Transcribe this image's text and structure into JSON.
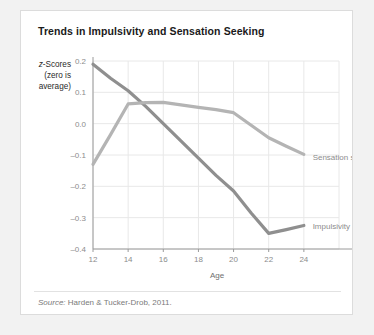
{
  "card": {
    "title": "Trends in Impulsivity and Sensation Seeking",
    "source_prefix": "Source:",
    "source_text": " Harden & Tucker-Drob, 2011."
  },
  "chart_data": {
    "type": "line",
    "title": "Trends in Impulsivity and Sensation Seeking",
    "xlabel": "Age",
    "ylabel": "z-Scores (zero is average)",
    "ylabel_line1": "z-Scores",
    "ylabel_line2": "(zero is",
    "ylabel_line3": "average)",
    "x": [
      12,
      13,
      14,
      15,
      16,
      17,
      18,
      19,
      20,
      21,
      22,
      23,
      24
    ],
    "xlim": [
      12,
      26
    ],
    "ylim": [
      -0.4,
      0.2
    ],
    "xticks": [
      12,
      14,
      16,
      18,
      20,
      22,
      24
    ],
    "xtick_labels": [
      "12",
      "14",
      "16",
      "18",
      "20",
      "22",
      "24"
    ],
    "yticks": [
      0.2,
      0.1,
      0.0,
      -0.1,
      -0.2,
      -0.3,
      -0.4
    ],
    "ytick_labels": [
      "0.2",
      "0.1",
      "0.0",
      "–0.1",
      "–0.2",
      "–0.3",
      "–0.4"
    ],
    "grid": true,
    "legend_position": "inline-right",
    "series": [
      {
        "name": "Impulsivity",
        "color": "#8f8f8f",
        "label_x": 24.5,
        "label_y": -0.325,
        "values": [
          0.19,
          0.145,
          0.105,
          0.055,
          0.0,
          -0.055,
          -0.11,
          -0.165,
          -0.215,
          -0.285,
          -0.35,
          -0.338,
          -0.325
        ]
      },
      {
        "name": "Sensation seeking",
        "color": "#b4b4b4",
        "label_x": 24.5,
        "label_y": -0.105,
        "values": [
          -0.13,
          -0.035,
          0.063,
          0.067,
          0.068,
          0.06,
          0.052,
          0.045,
          0.035,
          -0.005,
          -0.045,
          -0.072,
          -0.098
        ]
      }
    ]
  }
}
